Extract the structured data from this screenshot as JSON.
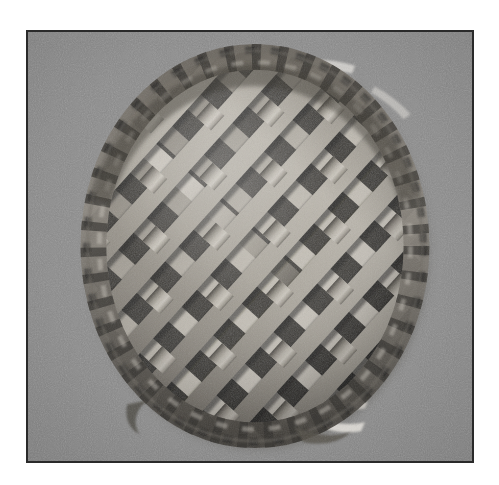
{
  "page": {
    "background_color": "#ffffff",
    "width": 499,
    "height": 485
  },
  "photo": {
    "name": "lattice-top-pie-photograph",
    "kind": "photograph",
    "color_mode": "grayscale",
    "subject": "Lattice-top pie",
    "description": "Overhead black-and-white photograph of a round lattice-crust pie with a crimped fluted edge, resting on a flat gray surface",
    "frame": {
      "border_color": "#2a2a2a",
      "border_width_px": 2,
      "left_px": 26,
      "top_px": 30,
      "width_px": 448,
      "height_px": 433
    },
    "background_color": "#8b8b8b",
    "surface_texture": "fine film grain on flat gray tabletop",
    "pie": {
      "center_x_px": 255,
      "center_y_px": 246,
      "radius_x_px": 172,
      "radius_y_px": 200,
      "crust_highlight_color": "#cfcac2",
      "crust_midtone_color": "#9d9891",
      "crust_shadow_color": "#4a4743",
      "filling_shadow_color": "#2f2e2c",
      "crimped_edge_color": "#5b574f",
      "lattice": {
        "strip_count_per_direction": 9,
        "strip_width_px": 20,
        "strip_pitch_px": 43,
        "rotation_deg": 42,
        "weave": "over-under basket weave",
        "opening_shape": "diamond"
      },
      "dish_rim_highlight_color": "#e6e3dd"
    }
  }
}
